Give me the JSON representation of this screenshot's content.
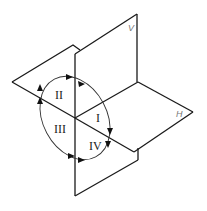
{
  "diagram": {
    "type": "three-plane quadrant projection",
    "planes": {
      "vertical": {
        "label": "V"
      },
      "horizontal": {
        "label": "H"
      }
    },
    "quadrants": [
      {
        "id": "I",
        "label": "I"
      },
      {
        "id": "II",
        "label": "II"
      },
      {
        "id": "III",
        "label": "III"
      },
      {
        "id": "IV",
        "label": "IV"
      }
    ],
    "colors": {
      "line": "#1a1a1a",
      "label": "#777777",
      "background": "#ffffff"
    }
  }
}
